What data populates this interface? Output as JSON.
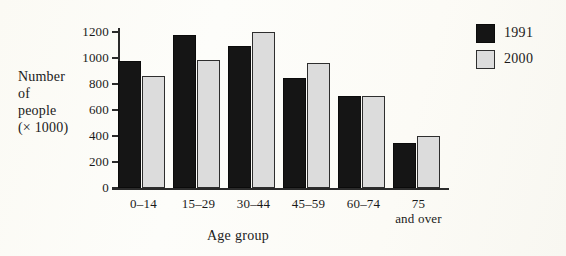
{
  "chart_data": {
    "type": "bar",
    "title": "",
    "xlabel": "Age group",
    "ylabel": "Number of people (× 1000)",
    "ylabel_lines": [
      "Number",
      "of",
      "people",
      "(× 1000)"
    ],
    "categories": [
      "0–14",
      "15–29",
      "30–44",
      "45–59",
      "60–74",
      "75 and over"
    ],
    "category_lines": [
      {
        "l1": "0–14",
        "l2": ""
      },
      {
        "l1": "15–29",
        "l2": ""
      },
      {
        "l1": "30–44",
        "l2": ""
      },
      {
        "l1": "45–59",
        "l2": ""
      },
      {
        "l1": "60–74",
        "l2": ""
      },
      {
        "l1": "75",
        "l2": "and over"
      }
    ],
    "series": [
      {
        "name": "1991",
        "color": "#151515",
        "values": [
          975,
          1175,
          1095,
          845,
          710,
          350
        ]
      },
      {
        "name": "2000",
        "color": "#dcdcdc",
        "values": [
          860,
          985,
          1200,
          960,
          710,
          400
        ]
      }
    ],
    "ylim": [
      0,
      1200
    ],
    "ytick_values": [
      0,
      200,
      400,
      600,
      800,
      1000,
      1200
    ],
    "ytick_labels": [
      "0",
      "200",
      "400",
      "600",
      "800",
      "1000",
      "1200"
    ],
    "grid": false,
    "legend_position": "right"
  },
  "legend": {
    "entries": [
      {
        "label": "1991",
        "series": "1991"
      },
      {
        "label": "2000",
        "series": "2000"
      }
    ]
  }
}
